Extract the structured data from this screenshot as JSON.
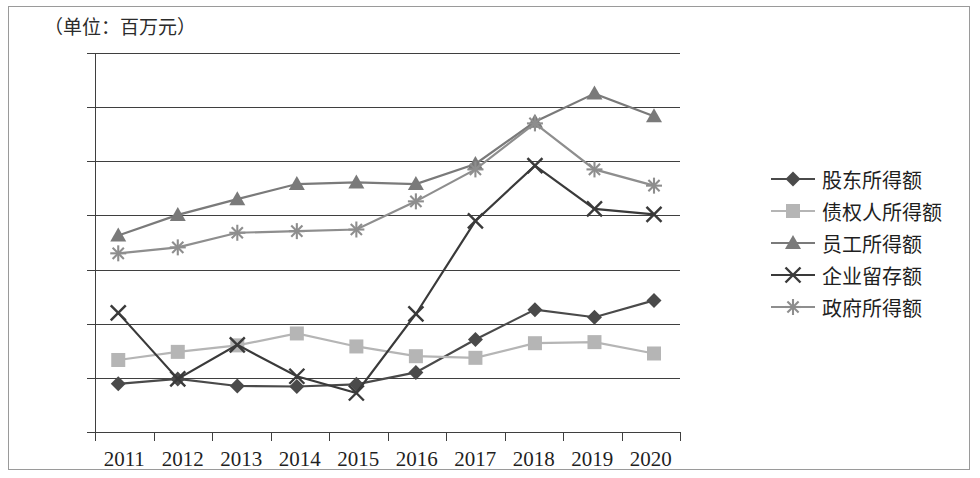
{
  "figure": {
    "unit_title": "（单位：百万元）"
  },
  "legend": {
    "position": "right",
    "items": [
      {
        "label": "股东所得额",
        "marker": "diamond-marker-icon",
        "color": "#4a4a4a"
      },
      {
        "label": "债权人所得额",
        "marker": "square-marker-icon",
        "color": "#b5b5b5"
      },
      {
        "label": "员工所得额",
        "marker": "triangle-marker-icon",
        "color": "#7a7a7a"
      },
      {
        "label": "企业留存额",
        "marker": "cross-marker-icon",
        "color": "#3a3a3a"
      },
      {
        "label": "政府所得额",
        "marker": "asterisk-marker-icon",
        "color": "#8e8e8e"
      }
    ]
  },
  "chart_data": {
    "type": "line",
    "title": "（单位：百万元）",
    "xlabel": "",
    "ylabel": "",
    "ylim": [
      0,
      700
    ],
    "yticks": [
      0,
      100,
      200,
      300,
      400,
      500,
      600,
      700
    ],
    "ytick_labels": [
      "0",
      "100",
      "200",
      "300",
      "400",
      "500",
      "600",
      "700"
    ],
    "grid": true,
    "legend_position": "right",
    "categories": [
      "2011",
      "2012",
      "2013",
      "2014",
      "2015",
      "2016",
      "2017",
      "2018",
      "2019",
      "2020"
    ],
    "series": [
      {
        "name": "股东所得额",
        "marker": "diamond",
        "color": "#4a4a4a",
        "values": [
          89,
          98,
          85,
          84,
          88,
          110,
          171,
          226,
          212,
          243
        ]
      },
      {
        "name": "债权人所得额",
        "marker": "square",
        "color": "#b5b5b5",
        "values": [
          133,
          148,
          160,
          182,
          158,
          140,
          137,
          164,
          166,
          145
        ]
      },
      {
        "name": "员工所得额",
        "marker": "triangle",
        "color": "#7a7a7a",
        "values": [
          363,
          401,
          430,
          458,
          461,
          458,
          495,
          573,
          625,
          583
        ]
      },
      {
        "name": "企业留存额",
        "marker": "cross",
        "color": "#3a3a3a",
        "values": [
          220,
          98,
          161,
          103,
          72,
          218,
          390,
          492,
          412,
          402
        ]
      },
      {
        "name": "政府所得额",
        "marker": "asterisk",
        "color": "#8e8e8e",
        "values": [
          330,
          341,
          368,
          371,
          374,
          426,
          485,
          570,
          485,
          455
        ]
      }
    ]
  }
}
